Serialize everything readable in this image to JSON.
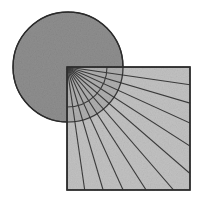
{
  "figure": {
    "background_color": "#ffffff",
    "width": 201,
    "height": 201
  },
  "chart_data": {
    "type": "diagram",
    "xlabel": "",
    "ylabel": "",
    "xlim": [
      0,
      201
    ],
    "ylim": [
      0,
      201
    ],
    "grid": false,
    "legend": "none",
    "shapes": [
      {
        "name": "circle",
        "kind": "circle",
        "cx": 68,
        "cy": 67,
        "r": 55,
        "fill": "#8f8f8f",
        "fill_opacity": 1,
        "stroke": "#2b2b2b",
        "stroke_width": 1.4
      },
      {
        "name": "square",
        "kind": "rect",
        "x": 67,
        "y": 67,
        "width": 123,
        "height": 123,
        "fill": "#b4b4b4",
        "fill_opacity": 0.82,
        "stroke": "#2b2b2b",
        "stroke_width": 1.4
      },
      {
        "name": "fan-arc",
        "kind": "arc",
        "cx": 67,
        "cy": 67,
        "r": 40,
        "start_angle_deg": 0,
        "end_angle_deg": 90,
        "stroke": "#3a3a3a",
        "stroke_width": 1.1,
        "fill": "none"
      }
    ],
    "fan": {
      "name": "radiating-lines",
      "origin_x": 67,
      "origin_y": 67,
      "count": 12,
      "start_angle_deg": 0,
      "end_angle_deg": 90,
      "stroke": "#3a3a3a",
      "stroke_width": 1.1,
      "angles_deg": [
        0,
        8.18,
        16.36,
        24.55,
        32.73,
        40.91,
        49.09,
        57.27,
        65.45,
        73.64,
        81.82,
        90
      ],
      "endpoints": [
        {
          "angle_deg": 0,
          "x": 190,
          "y": 67
        },
        {
          "angle_deg": 8.18,
          "x": 190,
          "y": 84.7
        },
        {
          "angle_deg": 16.36,
          "x": 190,
          "y": 103.1
        },
        {
          "angle_deg": 24.55,
          "x": 190,
          "y": 123.1
        },
        {
          "angle_deg": 32.73,
          "x": 190,
          "y": 146.1
        },
        {
          "angle_deg": 40.91,
          "x": 190,
          "y": 173.6
        },
        {
          "angle_deg": 49.09,
          "x": 173.6,
          "y": 190
        },
        {
          "angle_deg": 57.27,
          "x": 146.1,
          "y": 190
        },
        {
          "angle_deg": 65.45,
          "x": 123.1,
          "y": 190
        },
        {
          "angle_deg": 73.64,
          "x": 103.1,
          "y": 190
        },
        {
          "angle_deg": 81.82,
          "x": 84.7,
          "y": 190
        },
        {
          "angle_deg": 90,
          "x": 67,
          "y": 190
        }
      ]
    },
    "texture": {
      "name": "paper-grain",
      "enabled": true,
      "base_frequency": 0.85,
      "octaves": 3,
      "opacity": 0.3
    }
  }
}
